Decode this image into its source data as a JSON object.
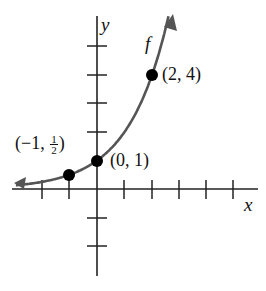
{
  "chart_data": {
    "type": "line",
    "title": "",
    "function_label": "f",
    "xlabel": "x",
    "ylabel": "y",
    "x_ticks": [
      -3,
      -2,
      -1,
      1,
      2,
      3,
      4,
      5
    ],
    "y_ticks": [
      -3,
      -2,
      1,
      2,
      3,
      4,
      5
    ],
    "xlim": [
      -3.1,
      5.3
    ],
    "ylim": [
      -3.1,
      6.2
    ],
    "grid": false,
    "tick_labels_shown": false,
    "series": [
      {
        "name": "f",
        "x": [
          -3,
          -2,
          -1,
          0,
          1,
          2,
          2.6
        ],
        "y": [
          0.125,
          0.25,
          0.5,
          1,
          2,
          4,
          6.06
        ],
        "color": "#555555",
        "arrows_both_ends": true
      }
    ],
    "highlighted_points": [
      {
        "x": -1,
        "y": 0.5,
        "label_main": "(−1, ",
        "label_num": "1",
        "label_den": "2",
        "label_end": ")"
      },
      {
        "x": 0,
        "y": 1,
        "label": "(0, 1)"
      },
      {
        "x": 2,
        "y": 4,
        "label": "(2, 4)"
      }
    ]
  }
}
